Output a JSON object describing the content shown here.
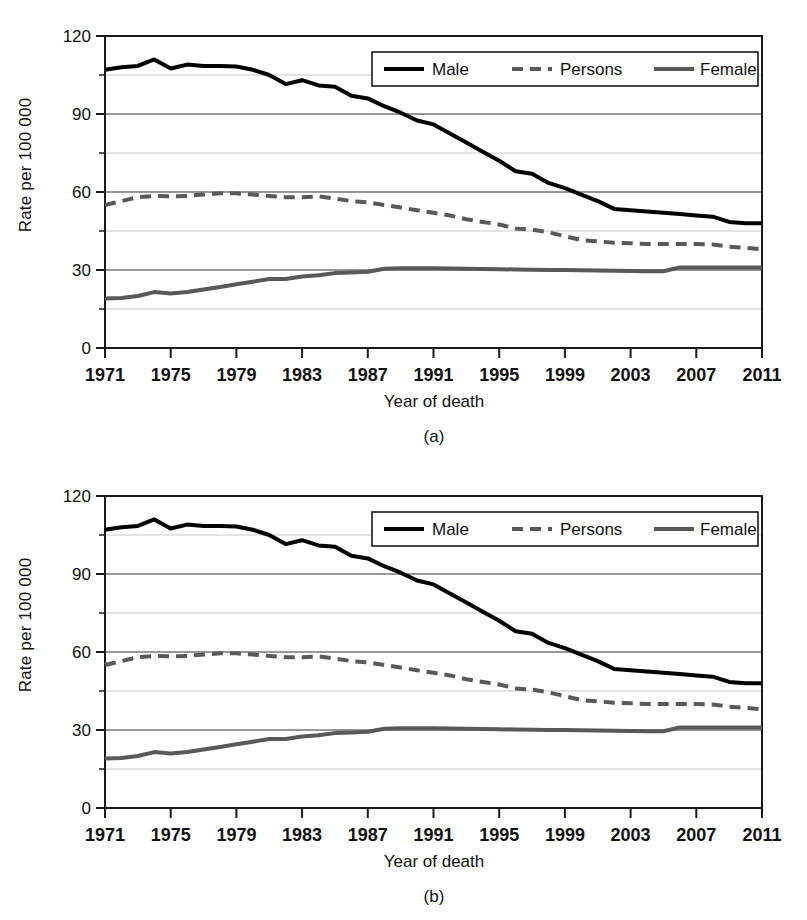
{
  "figure": {
    "panels": [
      {
        "caption": "(a)"
      },
      {
        "caption": "(b)"
      }
    ]
  },
  "chart_data": {
    "type": "line",
    "title": "",
    "xlabel": "Year of death",
    "ylabel": "Rate per 100 000",
    "xlim": [
      1971,
      2011
    ],
    "ylim": [
      0,
      120
    ],
    "grid": true,
    "legend_position": "top-right",
    "y_major_ticks": [
      0,
      30,
      60,
      90,
      120
    ],
    "y_minor_gridlines": [
      15,
      45,
      75,
      105
    ],
    "x_ticks": [
      1971,
      1975,
      1979,
      1983,
      1987,
      1991,
      1995,
      1999,
      2003,
      2007,
      2011
    ],
    "x": [
      1971,
      1972,
      1973,
      1974,
      1975,
      1976,
      1977,
      1978,
      1979,
      1980,
      1981,
      1982,
      1983,
      1984,
      1985,
      1986,
      1987,
      1988,
      1989,
      1990,
      1991,
      1992,
      1993,
      1994,
      1995,
      1996,
      1997,
      1998,
      1999,
      2000,
      2001,
      2002,
      2003,
      2004,
      2005,
      2006,
      2007,
      2008,
      2009,
      2010,
      2011
    ],
    "series": [
      {
        "name": "Male",
        "color": "#000000",
        "style": "solid",
        "width": 4,
        "values": [
          107.0,
          108.0,
          108.5,
          111.0,
          107.5,
          109.0,
          108.5,
          108.5,
          108.3,
          107.0,
          105.0,
          101.5,
          103.0,
          101.0,
          100.5,
          97.0,
          96.0,
          93.0,
          90.5,
          87.5,
          86.0,
          82.5,
          79.0,
          75.5,
          72.0,
          68.0,
          67.0,
          63.5,
          61.5,
          59.0,
          56.5,
          53.5,
          53.0,
          52.5,
          52.0,
          51.5,
          51.0,
          50.5,
          48.5,
          48.0,
          48.0
        ]
      },
      {
        "name": "Persons",
        "color": "#595959",
        "style": "dashed",
        "width": 4,
        "values": [
          55.0,
          56.5,
          58.0,
          58.5,
          58.3,
          58.5,
          59.0,
          59.5,
          59.5,
          59.0,
          58.5,
          58.0,
          58.0,
          58.3,
          57.5,
          56.5,
          56.0,
          55.0,
          54.0,
          53.0,
          52.0,
          51.0,
          49.5,
          48.5,
          47.5,
          46.0,
          45.5,
          44.5,
          43.0,
          41.5,
          41.0,
          40.5,
          40.3,
          40.0,
          40.0,
          40.0,
          40.0,
          39.8,
          39.0,
          38.5,
          38.0
        ]
      },
      {
        "name": "Female",
        "color": "#595959",
        "style": "solid",
        "width": 4,
        "values": [
          19.0,
          19.2,
          20.0,
          21.5,
          21.0,
          21.5,
          22.5,
          23.5,
          24.5,
          25.5,
          26.5,
          26.5,
          27.5,
          28.0,
          28.8,
          29.0,
          29.3,
          30.5,
          30.7,
          30.7,
          30.7,
          30.6,
          30.5,
          30.4,
          30.3,
          30.2,
          30.1,
          30.0,
          30.0,
          29.9,
          29.8,
          29.7,
          29.6,
          29.5,
          29.5,
          31.0,
          31.0,
          31.0,
          31.0,
          31.0,
          31.0
        ]
      }
    ]
  }
}
